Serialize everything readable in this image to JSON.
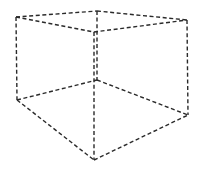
{
  "diagram": {
    "title": "",
    "type": "dashed wireframe cube",
    "stroke_color": "#2a2a2a",
    "background": "#ffffff",
    "vertices": {
      "top_left": [
        16,
        17
      ],
      "top_back": [
        97,
        11
      ],
      "top_right": [
        187,
        20
      ],
      "top_front": [
        94,
        32
      ],
      "bottom_left": [
        17,
        100
      ],
      "bottom_back": [
        97,
        80
      ],
      "bottom_right": [
        188,
        115
      ],
      "bottom_front": [
        94,
        160
      ]
    },
    "edges": [
      {
        "name": "edge-top-left-back",
        "from": "top_left",
        "to": "top_back"
      },
      {
        "name": "edge-top-back-right",
        "from": "top_back",
        "to": "top_right"
      },
      {
        "name": "edge-top-left-front",
        "from": "top_left",
        "to": "top_front"
      },
      {
        "name": "edge-top-front-right",
        "from": "top_front",
        "to": "top_right"
      },
      {
        "name": "edge-vertical-left",
        "from": "top_left",
        "to": "bottom_left"
      },
      {
        "name": "edge-vertical-back",
        "from": "top_back",
        "to": "bottom_back"
      },
      {
        "name": "edge-vertical-right",
        "from": "top_right",
        "to": "bottom_right"
      },
      {
        "name": "edge-vertical-front",
        "from": "top_front",
        "to": "bottom_front"
      },
      {
        "name": "edge-bottom-left-back",
        "from": "bottom_left",
        "to": "bottom_back"
      },
      {
        "name": "edge-bottom-back-right",
        "from": "bottom_back",
        "to": "bottom_right"
      },
      {
        "name": "edge-bottom-left-front",
        "from": "bottom_left",
        "to": "bottom_front"
      },
      {
        "name": "edge-bottom-front-right",
        "from": "bottom_front",
        "to": "bottom_right"
      }
    ]
  }
}
